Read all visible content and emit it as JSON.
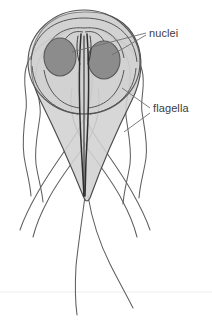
{
  "figure": {
    "organism": "Giardia trophozoite",
    "background_color": "#ffffff",
    "canvas": {
      "width": 212,
      "height": 321
    }
  },
  "labels": [
    {
      "id": "nuclei",
      "text": "nuclei",
      "x": 149,
      "y": 37,
      "color": "#3c3c3c",
      "font_size": 11,
      "leader_count": 2
    },
    {
      "id": "flagella",
      "text": "flagella",
      "x": 153,
      "y": 112,
      "color": "#3c3c3c",
      "font_size": 11,
      "leader_count": 2
    }
  ],
  "structures": {
    "body": {
      "name": "cell-body",
      "fill": "#d2d2d2",
      "stroke": "#4a4a4a",
      "opacity": 0.85,
      "description": "teardrop / pear-shaped body, broad rounded top tapering to a point at bottom"
    },
    "ventral_disc": {
      "name": "ventral-disc",
      "fill": "#c9c9c9",
      "stroke": "#555555",
      "description": "large circular adhesive disc overlapping the anterior body"
    },
    "nuclei": {
      "name": "nuclei",
      "count": 2,
      "fill": "#8c8c8c",
      "stroke": "#5a5a5a",
      "left": {
        "cx": 60,
        "cy": 57,
        "rx": 16,
        "ry": 19
      },
      "right": {
        "cx": 104,
        "cy": 60,
        "rx": 16,
        "ry": 19
      }
    },
    "axonemes": {
      "name": "central-axonemes",
      "stroke": "#2e2e2e",
      "description": "dark paired vertical rods running down the midline"
    },
    "flagella": {
      "name": "flagella",
      "count": 8,
      "stroke": "#5a5a5a",
      "description": "eight long curving whip-like flagella emerging laterally and posteriorly"
    },
    "baseline": {
      "name": "faint-horizontal-rule",
      "y": 292,
      "stroke": "#ededed"
    }
  },
  "colors": {
    "body_fill": "#d2d2d2",
    "nucleus_fill": "#8c8c8c",
    "outline": "#4a4a4a",
    "axoneme": "#2e2e2e",
    "text": "#3c3c3c",
    "leader_line": "#6e6e6e"
  }
}
